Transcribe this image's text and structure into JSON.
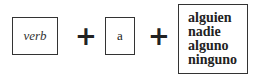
{
  "diagram": {
    "terms": [
      {
        "label": "verb",
        "style": "italic"
      },
      {
        "label": "a",
        "style": "normal"
      },
      {
        "words": [
          "alguien",
          "nadie",
          "alguno",
          "ninguno"
        ],
        "style": "bold"
      }
    ],
    "operators": [
      "+",
      "+"
    ]
  }
}
